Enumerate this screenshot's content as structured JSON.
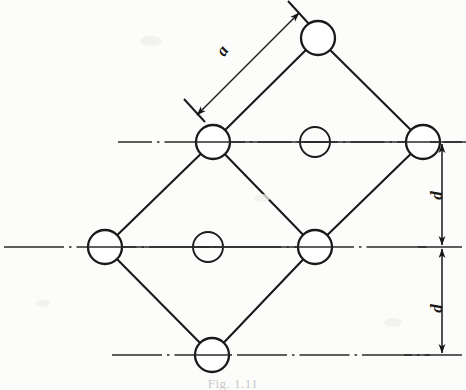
{
  "figure": {
    "type": "engineering-lattice-diagram",
    "caption": "Fig. 1.11",
    "background_color": "#fcfcfb",
    "line_color": "#1a1a1a",
    "labels": {
      "a": "a",
      "d_upper": "d",
      "d_lower": "d"
    },
    "nodes": [
      {
        "id": "top",
        "name": "node-top",
        "cx": 318,
        "cy": 38,
        "r": 17,
        "kind": "lattice-node"
      },
      {
        "id": "mid-left",
        "name": "node-mid-left",
        "cx": 213,
        "cy": 142,
        "r": 17,
        "kind": "lattice-node"
      },
      {
        "id": "row1-center",
        "name": "node-row1-center",
        "cx": 315,
        "cy": 142,
        "r": 15,
        "kind": "interstitial-node"
      },
      {
        "id": "mid-right",
        "name": "node-mid-right",
        "cx": 423,
        "cy": 142,
        "r": 17,
        "kind": "lattice-node"
      },
      {
        "id": "far-left",
        "name": "node-far-left",
        "cx": 105,
        "cy": 247,
        "r": 17,
        "kind": "lattice-node"
      },
      {
        "id": "row2-center",
        "name": "node-row2-center",
        "cx": 208,
        "cy": 247,
        "r": 15,
        "kind": "interstitial-node"
      },
      {
        "id": "row2-right",
        "name": "node-row2-right",
        "cx": 315,
        "cy": 247,
        "r": 17,
        "kind": "lattice-node"
      },
      {
        "id": "bottom",
        "name": "node-bottom",
        "cx": 212,
        "cy": 355,
        "r": 17,
        "kind": "lattice-node"
      }
    ],
    "edges": [
      {
        "name": "edge-top-to-mid-left",
        "from": "top",
        "to": "mid-left"
      },
      {
        "name": "edge-top-to-mid-right",
        "from": "top",
        "to": "mid-right"
      },
      {
        "name": "edge-mid-left-to-row2-right",
        "from": "mid-left",
        "to": "row2-right"
      },
      {
        "name": "edge-mid-right-to-row2-right",
        "from": "mid-right",
        "to": "row2-right"
      },
      {
        "name": "edge-mid-left-to-far-left",
        "from": "mid-left",
        "to": "far-left"
      },
      {
        "name": "edge-far-left-to-bottom",
        "from": "far-left",
        "to": "bottom"
      },
      {
        "name": "edge-bottom-to-row2-right",
        "from": "bottom",
        "to": "row2-right"
      }
    ],
    "center_lines": [
      {
        "name": "center-line-row1",
        "y": 142,
        "x1": 118,
        "x2": 466
      },
      {
        "name": "center-line-row2",
        "y": 247,
        "x1": 4,
        "x2": 430
      },
      {
        "name": "center-line-row3",
        "y": 355,
        "x1": 112,
        "x2": 430
      }
    ],
    "dimensions": [
      {
        "name": "dimension-a",
        "label": "a",
        "orientation": "diagonal",
        "from": {
          "x": 196,
          "y": 114
        },
        "to": {
          "x": 300,
          "y": 12
        },
        "extension_lines": [
          {
            "x1": 186,
            "y1": 100,
            "x2": 204,
            "y2": 120
          },
          {
            "x1": 290,
            "y1": 2,
            "x2": 308,
            "y2": 22
          }
        ]
      },
      {
        "name": "dimension-d-upper",
        "label": "d",
        "orientation": "vertical",
        "x": 442,
        "y1": 142,
        "y2": 247
      },
      {
        "name": "dimension-d-lower",
        "label": "d",
        "orientation": "vertical",
        "x": 442,
        "y1": 247,
        "y2": 355
      }
    ]
  }
}
